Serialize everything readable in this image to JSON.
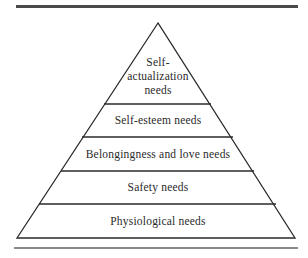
{
  "diagram": {
    "type": "pyramid",
    "levels": [
      {
        "label_lines": [
          "Self-",
          "actualization",
          "needs"
        ]
      },
      {
        "label": "Self-esteem needs"
      },
      {
        "label": "Belongingness and love needs"
      },
      {
        "label": "Safety needs"
      },
      {
        "label": "Physiological needs"
      }
    ]
  },
  "colors": {
    "line": "#2a2a2a",
    "text": "#2a2a2a",
    "background": "#ffffff"
  }
}
